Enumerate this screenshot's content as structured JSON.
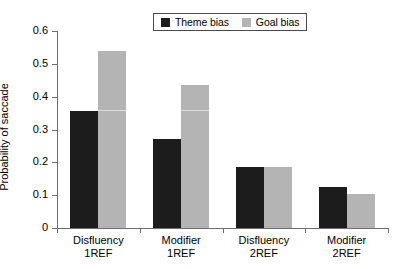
{
  "chart_data": {
    "type": "bar",
    "title": "",
    "xlabel": "",
    "ylabel": "Probability of saccade",
    "ylim": [
      0,
      0.6
    ],
    "ytick_labels": [
      "0",
      "0.1",
      "0.2",
      "0.3",
      "0.4",
      "0.5",
      "0.6"
    ],
    "ytick_values": [
      0,
      0.1,
      0.2,
      0.3,
      0.4,
      0.5,
      0.6
    ],
    "grid": false,
    "legend_position": "top-center",
    "categories": [
      {
        "line1": "Disfluency",
        "line2": "1REF"
      },
      {
        "line1": "Modifier",
        "line2": "1REF"
      },
      {
        "line1": "Disfluency",
        "line2": "2REF"
      },
      {
        "line1": "Modifier",
        "line2": "2REF"
      }
    ],
    "category_labels": [
      "Disfluency 1REF",
      "Modifier 1REF",
      "Disfluency 2REF",
      "Modifier 2REF"
    ],
    "series": [
      {
        "name": "Theme bias",
        "color": "#1c1c1c",
        "values": [
          0.355,
          0.27,
          0.185,
          0.125
        ]
      },
      {
        "name": "Goal bias",
        "color": "#b4b4b4",
        "values": [
          0.54,
          0.435,
          0.185,
          0.105
        ]
      }
    ]
  },
  "legend": {
    "entries": [
      {
        "label": "Theme bias",
        "color": "#1c1c1c"
      },
      {
        "label": "Goal bias",
        "color": "#b4b4b4"
      }
    ]
  },
  "axes": {
    "y_title": "Probability of saccade"
  }
}
